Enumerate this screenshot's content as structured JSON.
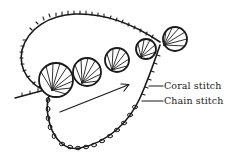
{
  "diagram": {
    "type": "embroidery stitch illustration",
    "labels": {
      "coral_stitch": "Coral stitch",
      "chain_stitch": "Chain stitch"
    },
    "colors": {
      "ink": "#1a1a1a",
      "background": "#ffffff"
    },
    "elements": {
      "shells": 5,
      "arrow_direction": "up-right"
    }
  }
}
